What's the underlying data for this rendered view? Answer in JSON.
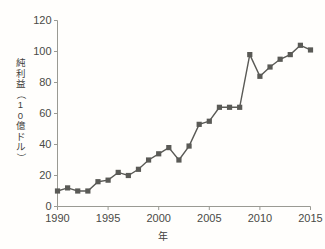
{
  "chart_data": {
    "type": "line",
    "title": "",
    "subtitle": "",
    "xlabel": "年",
    "ylabel": "純利益（10億ドル）",
    "ylabel_chars": [
      "純",
      "利",
      "益",
      "（",
      "1",
      "0",
      "億",
      "ド",
      "ル",
      "）"
    ],
    "x": [
      1990,
      1991,
      1992,
      1993,
      1994,
      1995,
      1996,
      1997,
      1998,
      1999,
      2000,
      2001,
      2002,
      2003,
      2004,
      2005,
      2006,
      2007,
      2008,
      2009,
      2010,
      2011,
      2012,
      2013,
      2014,
      2015
    ],
    "values": [
      10,
      12,
      10,
      10,
      16,
      17,
      22,
      20,
      24,
      30,
      34,
      38,
      30,
      39,
      53,
      55,
      64,
      64,
      64,
      98,
      84,
      90,
      95,
      98,
      104,
      101
    ],
    "series": [
      {
        "name": "純利益",
        "values": [
          10,
          12,
          10,
          10,
          16,
          17,
          22,
          20,
          24,
          30,
          34,
          38,
          30,
          39,
          53,
          55,
          64,
          64,
          64,
          98,
          84,
          90,
          95,
          98,
          104,
          101
        ]
      }
    ],
    "xlim": [
      1990,
      2015
    ],
    "ylim": [
      0,
      120
    ],
    "xticks": [
      1990,
      1995,
      2000,
      2005,
      2010,
      2015
    ],
    "xtick_labels": [
      "1990",
      "1995",
      "2000",
      "2005",
      "2010",
      "2015"
    ],
    "yticks": [
      0,
      20,
      40,
      60,
      80,
      100,
      120
    ],
    "ytick_labels": [
      "0",
      "20",
      "40",
      "60",
      "80",
      "100",
      "120"
    ],
    "grid": false,
    "legend": "none",
    "marker": "square",
    "line_color": "#5a5a56",
    "marker_color": "#5a5a56",
    "axis_color": "#9a9a93",
    "background_color": "#fffefc",
    "text_color": "#4a4a46"
  }
}
